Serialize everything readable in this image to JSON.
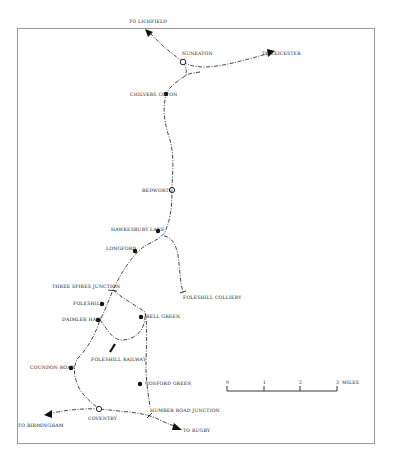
{
  "map": {
    "title_visible": false,
    "colors": {
      "line": "#333333",
      "frame": "#9a9a9a",
      "background": "#ffffff"
    },
    "destinations": {
      "lichfield": "TO LICHFIELD",
      "leicester": "TO LEICESTER",
      "birmingham": "TO BIRMINGHAM",
      "rugby": "TO RUGBY"
    },
    "stations": {
      "nuneaton": "NUNEATON",
      "chilvers_coton": "CHILVERS COTON",
      "bedworth": "BEDWORTH",
      "hawkesbury_lane": "HAWKESBURY LANE",
      "longford": "LONGFORD",
      "three_spires_junction": "THREE SPIRES JUNCTION",
      "foleshill": "FOLESHILL",
      "daimler_halt": "DAIMLER HALT",
      "bell_green": "BELL GREEN",
      "foleshill_railway": "FOLESHILL RAILWAY",
      "foleshill_colliery": "FOLESHILL COLLIERY",
      "coundon_road": "COUNDON ROAD",
      "gosford_green": "GOSFORD GREEN",
      "humber_road_junction": "HUMBER ROAD JUNCTION",
      "coventry": "COVENTRY"
    },
    "scale": {
      "ticks": [
        "0",
        "1",
        "2",
        "3"
      ],
      "unit": "MILES"
    }
  }
}
